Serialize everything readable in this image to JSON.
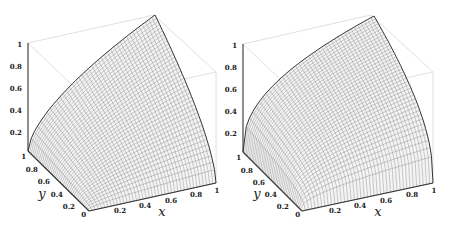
{
  "chart_data": [
    {
      "type": "surface3d",
      "title": "",
      "xlabel": "x",
      "ylabel": "y",
      "zlabel": "",
      "x_ticks": [
        "0.2",
        "0.4",
        "0.6",
        "0.8",
        "1"
      ],
      "y_ticks": [
        "0",
        "0.2",
        "0.4",
        "0.6",
        "0.8",
        "1"
      ],
      "z_ticks": [
        "0.2",
        "0.4",
        "0.6",
        "0.8",
        "1"
      ],
      "xlim": [
        0,
        1
      ],
      "ylim": [
        0,
        1
      ],
      "zlim": [
        0,
        1
      ],
      "surface": "z increases from 0 at edges x=0 / y=0 toward 1 at (1,1); concave curved edges",
      "edge_exponent": 0.6,
      "mesh": "wireframe grid, ~40x40",
      "corners": {
        "(0,0)": 0,
        "(1,0)": 0,
        "(0,1)": 0,
        "(1,1)": 1
      }
    },
    {
      "type": "surface3d",
      "title": "",
      "xlabel": "x",
      "ylabel": "y",
      "zlabel": "",
      "x_ticks": [
        "0.2",
        "0.4",
        "0.6",
        "0.8",
        "1"
      ],
      "y_ticks": [
        "0",
        "0.2",
        "0.4",
        "0.6",
        "0.8",
        "1"
      ],
      "z_ticks": [
        "0.2",
        "0.4",
        "0.6",
        "0.8",
        "1"
      ],
      "xlim": [
        0,
        1
      ],
      "ylim": [
        0,
        1
      ],
      "zlim": [
        0,
        1
      ],
      "surface": "z increases steeply near edges then saturates toward 1 at (1,1); more strongly concave edges",
      "edge_exponent": 0.4,
      "mesh": "wireframe grid, ~40x40",
      "corners": {
        "(0,0)": 0,
        "(1,0)": 0,
        "(0,1)": 0,
        "(1,1)": 1
      }
    }
  ],
  "panels": [
    {
      "xlabel": "x",
      "ylabel": "y",
      "z_ticks": [
        "1",
        "0.8",
        "0.6",
        "0.4",
        "0.2"
      ],
      "y_ticks": [
        "1",
        "0.8",
        "0.6",
        "0.4",
        "0.2",
        "0"
      ],
      "x_ticks": [
        "0.2",
        "0.4",
        "0.6",
        "0.8",
        "1"
      ]
    },
    {
      "xlabel": "x",
      "ylabel": "y",
      "z_ticks": [
        "1",
        "0.8",
        "0.6",
        "0.4",
        "0.2"
      ],
      "y_ticks": [
        "1",
        "0.8",
        "0.6",
        "0.4",
        "0.2",
        "0"
      ],
      "x_ticks": [
        "0.2",
        "0.4",
        "0.6",
        "0.8",
        "1"
      ]
    }
  ]
}
